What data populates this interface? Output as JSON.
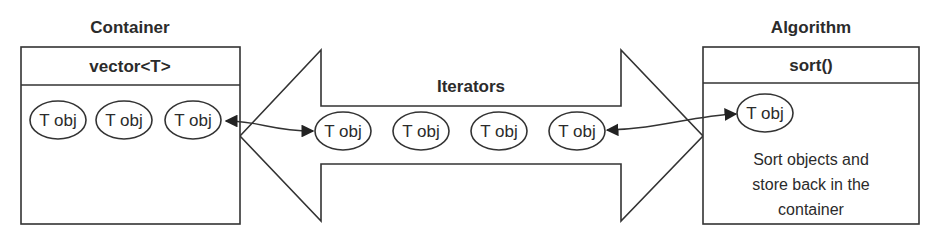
{
  "container": {
    "title": "Container",
    "header": "vector<T>",
    "objects": [
      "T obj",
      "T obj",
      "T obj"
    ]
  },
  "iterators": {
    "label": "Iterators",
    "objects": [
      "T obj",
      "T obj",
      "T obj",
      "T obj"
    ]
  },
  "algorithm": {
    "title": "Algorithm",
    "header": "sort()",
    "object": "T obj",
    "description_lines": [
      "Sort objects and",
      "store back in the",
      "container"
    ]
  },
  "colors": {
    "stroke": "#333333",
    "text": "#2b2b2b",
    "background": "#ffffff"
  }
}
